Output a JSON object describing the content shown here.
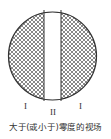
{
  "figure": {
    "type": "field-of-view diagram",
    "regions": [
      {
        "id": "left",
        "label": "I",
        "fill": "crosshatch"
      },
      {
        "id": "center",
        "label": "II",
        "fill": "white"
      },
      {
        "id": "right",
        "label": "I",
        "fill": "crosshatch"
      }
    ],
    "labels": {
      "left": "I",
      "center": "II",
      "right": "I"
    },
    "caption": "大于(或小于)零度的视场",
    "colors": {
      "stroke": "#333333",
      "hatch": "#555555",
      "background": "#ffffff"
    }
  }
}
